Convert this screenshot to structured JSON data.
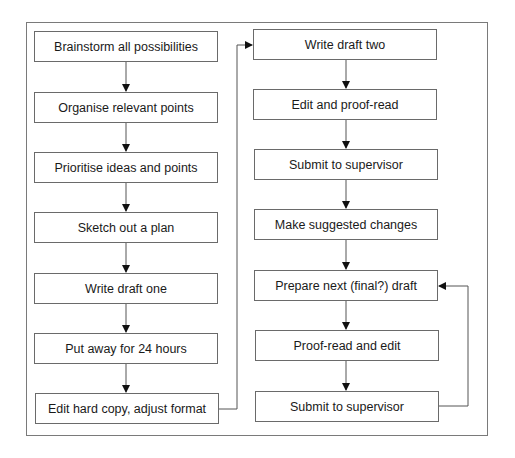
{
  "diagram": {
    "type": "flowchart",
    "left_column": [
      {
        "id": "L1",
        "label": "Brainstorm all possibilities"
      },
      {
        "id": "L2",
        "label": "Organise relevant points"
      },
      {
        "id": "L3",
        "label": "Prioritise ideas and points"
      },
      {
        "id": "L4",
        "label": "Sketch out a plan"
      },
      {
        "id": "L5",
        "label": "Write draft one"
      },
      {
        "id": "L6",
        "label": "Put away for 24 hours"
      },
      {
        "id": "L7",
        "label": "Edit hard copy, adjust format"
      }
    ],
    "right_column": [
      {
        "id": "R1",
        "label": "Write draft two"
      },
      {
        "id": "R2",
        "label": "Edit and proof-read"
      },
      {
        "id": "R3",
        "label": "Submit to supervisor"
      },
      {
        "id": "R4",
        "label": "Make suggested changes"
      },
      {
        "id": "R5",
        "label": "Prepare next (final?) draft"
      },
      {
        "id": "R6",
        "label": "Proof-read and edit"
      },
      {
        "id": "R7",
        "label": "Submit to supervisor"
      }
    ],
    "edges": [
      [
        "L1",
        "L2"
      ],
      [
        "L2",
        "L3"
      ],
      [
        "L3",
        "L4"
      ],
      [
        "L4",
        "L5"
      ],
      [
        "L5",
        "L6"
      ],
      [
        "L6",
        "L7"
      ],
      [
        "L7",
        "R1"
      ],
      [
        "R1",
        "R2"
      ],
      [
        "R2",
        "R3"
      ],
      [
        "R3",
        "R4"
      ],
      [
        "R4",
        "R5"
      ],
      [
        "R5",
        "R6"
      ],
      [
        "R6",
        "R7"
      ],
      [
        "R7",
        "R5"
      ]
    ],
    "colors": {
      "line": "#6a6a6a",
      "text": "#1a1a1a",
      "background": "#ffffff"
    }
  }
}
